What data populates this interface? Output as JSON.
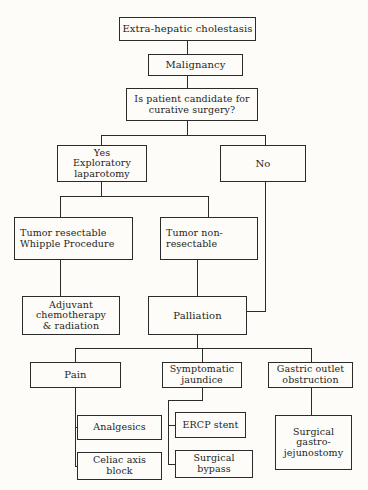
{
  "diagram": {
    "type": "flowchart",
    "background_color": "#fdfcf8",
    "line_color": "#2b2b2b",
    "text_color": "#1e1e1e",
    "nodes": {
      "root": "Extra-hepatic cholestasis",
      "malignancy": "Malignancy",
      "decision": "Is patient candidate for\ncurative surgery?",
      "yes_branch": "Yes\nExploratory\nlaparotomy",
      "no_branch": "No",
      "tumor_resectable": "Tumor resectable\nWhipple Procedure",
      "tumor_non_resectable": "Tumor non-\nresectable",
      "adjuvant": "Adjuvant\nchemotherapy\n& radiation",
      "palliation": "Palliation",
      "pain": "Pain",
      "symptomatic_jaundice": "Symptomatic\njaundice",
      "gastric_outlet_obstruction": "Gastric outlet\nobstruction",
      "analgesics": "Analgesics",
      "celiac_axis_block": "Celiac axis\nblock",
      "ercp_stent": "ERCP stent",
      "surgical_bypass": "Surgical\nbypass",
      "surgical_gastrojejunostomy": "Surgical\ngastro-\njejunostomy"
    }
  }
}
